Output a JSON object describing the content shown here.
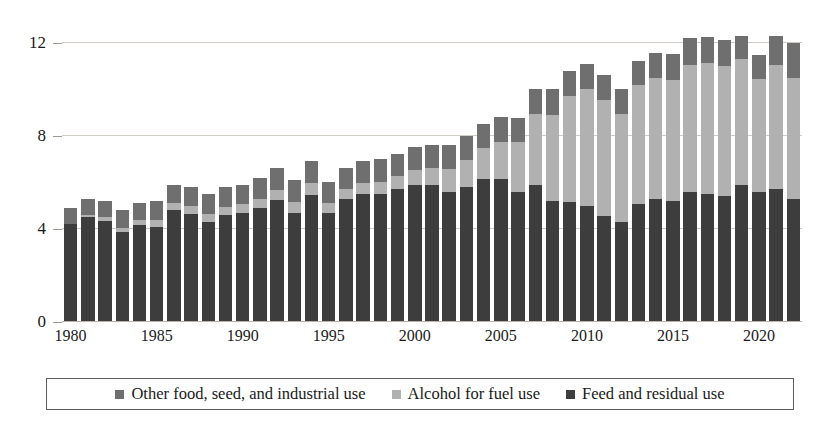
{
  "chart_data": {
    "type": "bar",
    "subtype": "stacked-bar",
    "title": "",
    "subtitle": "",
    "xlabel": "",
    "ylabel": "",
    "ylim": [
      0,
      12.8
    ],
    "yticks": [
      0,
      4,
      8,
      12
    ],
    "ytick_labels": [
      "0",
      "4",
      "8",
      "12"
    ],
    "grid": true,
    "grid_axis": "y",
    "legend_position": "bottom",
    "xtick_labels": [
      "1980",
      "1985",
      "1990",
      "1995",
      "2000",
      "2005",
      "2010",
      "2015",
      "2020"
    ],
    "categories": [
      "1980",
      "1981",
      "1982",
      "1983",
      "1984",
      "1985",
      "1986",
      "1987",
      "1988",
      "1989",
      "1990",
      "1991",
      "1992",
      "1993",
      "1994",
      "1995",
      "1996",
      "1997",
      "1998",
      "1999",
      "2000",
      "2001",
      "2002",
      "2003",
      "2004",
      "2005",
      "2006",
      "2007",
      "2008",
      "2009",
      "2010",
      "2011",
      "2012",
      "2013",
      "2014",
      "2015",
      "2016",
      "2017",
      "2018",
      "2019",
      "2020",
      "2021",
      "2022"
    ],
    "series": [
      {
        "name": "Feed and residual use",
        "color": "#3d3d3d",
        "values": [
          4.2,
          4.5,
          4.35,
          3.85,
          4.15,
          4.1,
          4.8,
          4.65,
          4.3,
          4.6,
          4.7,
          4.9,
          5.25,
          4.7,
          5.45,
          4.7,
          5.3,
          5.5,
          5.5,
          5.7,
          5.9,
          5.9,
          5.6,
          5.8,
          6.15,
          6.15,
          5.6,
          5.9,
          5.2,
          5.15,
          5.0,
          4.55,
          4.3,
          5.05,
          5.3,
          5.2,
          5.6,
          5.5,
          5.4,
          5.9,
          5.6,
          5.7,
          5.3
        ]
      },
      {
        "name": "Alcohol for fuel use",
        "color": "#b1b1b1",
        "values": [
          0.03,
          0.08,
          0.14,
          0.18,
          0.23,
          0.28,
          0.3,
          0.32,
          0.34,
          0.36,
          0.35,
          0.4,
          0.43,
          0.46,
          0.53,
          0.4,
          0.43,
          0.48,
          0.53,
          0.57,
          0.63,
          0.71,
          0.99,
          1.17,
          1.32,
          1.6,
          2.12,
          3.03,
          3.71,
          4.57,
          5.02,
          5.0,
          4.65,
          5.13,
          5.2,
          5.21,
          5.43,
          5.61,
          5.6,
          5.38,
          4.85,
          5.32,
          5.18
        ]
      },
      {
        "name": "Other food, seed, and industrial use",
        "color": "#6f6f6f",
        "values": [
          0.67,
          0.72,
          0.71,
          0.77,
          0.72,
          0.82,
          0.8,
          0.83,
          0.86,
          0.84,
          0.85,
          0.9,
          0.92,
          0.94,
          0.92,
          0.9,
          0.87,
          0.92,
          0.97,
          0.93,
          0.97,
          0.99,
          1.01,
          1.03,
          1.03,
          1.05,
          1.06,
          1.07,
          1.09,
          1.08,
          1.08,
          1.05,
          1.05,
          1.02,
          1.07,
          1.09,
          1.17,
          1.15,
          1.1,
          1.02,
          1.01,
          1.26,
          1.52
        ]
      }
    ]
  },
  "legend": {
    "items": [
      {
        "label": "Other food, seed, and industrial use",
        "color": "#6f6f6f"
      },
      {
        "label": "Alcohol for fuel use",
        "color": "#b1b1b1"
      },
      {
        "label": "Feed and residual use",
        "color": "#3d3d3d"
      }
    ]
  }
}
